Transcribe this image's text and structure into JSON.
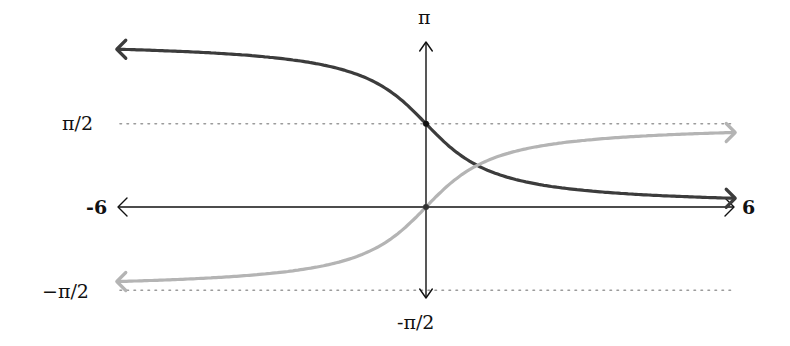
{
  "chart_data": {
    "type": "line",
    "title": "",
    "xlabel": "",
    "ylabel": "",
    "xlim": [
      -6,
      6
    ],
    "ylim": [
      -1.5708,
      3.1416
    ],
    "grid": false,
    "x_tick_labels": {
      "left": "-6",
      "right": "6"
    },
    "y_tick_labels": {
      "top": "π",
      "half_pi": "π/2",
      "neg_half_pi": "−π/2",
      "bottom": "-π/2"
    },
    "reference_lines": [
      {
        "y": 1.5708,
        "label": "π/2",
        "style": "dotted",
        "color": "#9a9a9a"
      },
      {
        "y": -1.5708,
        "label": "−π/2",
        "style": "dotted",
        "color": "#9a9a9a"
      }
    ],
    "series": [
      {
        "name": "arccot(x) = π/2 − arctan(x)",
        "color": "#3c3c3c",
        "x": [
          -6,
          -4,
          -2,
          -1,
          0,
          1,
          2,
          4,
          6
        ],
        "y": [
          2.976,
          2.897,
          2.678,
          2.356,
          1.571,
          0.785,
          0.464,
          0.245,
          0.165
        ],
        "marked_point": [
          0,
          1.571
        ]
      },
      {
        "name": "arctan(x)",
        "color": "#b4b4b4",
        "x": [
          -6,
          -4,
          -2,
          -1,
          0,
          1,
          2,
          4,
          6
        ],
        "y": [
          -1.406,
          -1.326,
          -1.107,
          -0.785,
          0,
          0.785,
          1.107,
          1.326,
          1.406
        ],
        "marked_point": [
          0,
          0
        ]
      }
    ]
  }
}
